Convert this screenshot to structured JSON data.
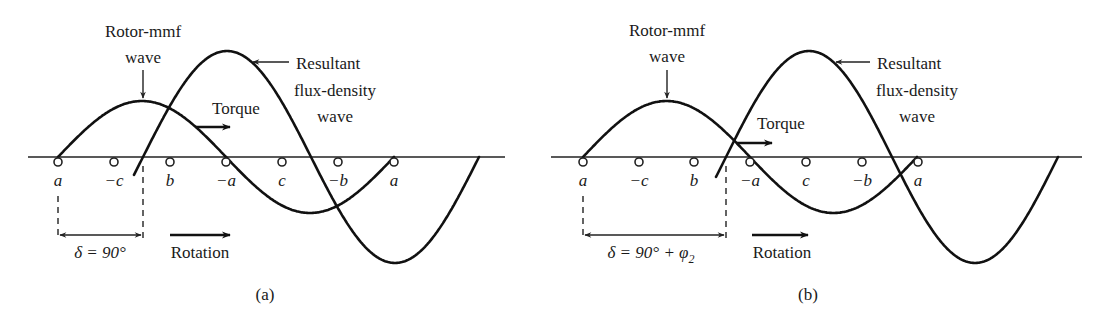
{
  "figure": {
    "panels": [
      {
        "id": "a",
        "caption": "(a)",
        "offset_x": 0,
        "axis": {
          "y": 157,
          "x_start": 28,
          "x_end": 505
        },
        "slots": [
          {
            "x": 58,
            "label": "a"
          },
          {
            "x": 114,
            "label": "−c"
          },
          {
            "x": 170,
            "label": "b"
          },
          {
            "x": 226,
            "label": "−a"
          },
          {
            "x": 282,
            "label": "c"
          },
          {
            "x": 338,
            "label": "−b"
          },
          {
            "x": 394,
            "label": "a"
          }
        ],
        "rotor_mmf_wave": {
          "label_line1": "Rotor-mmf",
          "label_line2": "wave",
          "start_x": 58,
          "half_period": 168,
          "amplitude": 56,
          "end_x": 394
        },
        "resultant_flux_wave": {
          "label_line1": "Resultant",
          "label_line2": "flux-density",
          "label_line3": "wave",
          "zero_x": 143,
          "half_period": 168,
          "amplitude": 106,
          "start_x": 134,
          "end_x": 479
        },
        "torque_label": "Torque",
        "rotation_label": "Rotation",
        "delta_label": "δ = 90°",
        "delta_from_x": 58,
        "delta_to_x": 143
      },
      {
        "id": "b",
        "caption": "(b)",
        "offset_x": 0,
        "axis": {
          "y": 157,
          "x_start": 551,
          "x_end": 1082
        },
        "slots": [
          {
            "x": 583,
            "label": "a"
          },
          {
            "x": 639,
            "label": "−c"
          },
          {
            "x": 694,
            "label": "b"
          },
          {
            "x": 750,
            "label": "−a"
          },
          {
            "x": 806,
            "label": "c"
          },
          {
            "x": 862,
            "label": "−b"
          },
          {
            "x": 918,
            "label": "a"
          }
        ],
        "rotor_mmf_wave": {
          "label_line1": "Rotor-mmf",
          "label_line2": "wave",
          "start_x": 583,
          "half_period": 167,
          "amplitude": 56,
          "end_x": 917
        },
        "resultant_flux_wave": {
          "label_line1": "Resultant",
          "label_line2": "flux-density",
          "label_line3": "wave",
          "zero_x": 726,
          "half_period": 166,
          "amplitude": 106,
          "start_x": 716,
          "end_x": 1058
        },
        "torque_label": "Torque",
        "rotation_label": "Rotation",
        "delta_label": "δ = 90° + φ",
        "delta_subscript": "2",
        "delta_from_x": 583,
        "delta_to_x": 726
      }
    ]
  }
}
